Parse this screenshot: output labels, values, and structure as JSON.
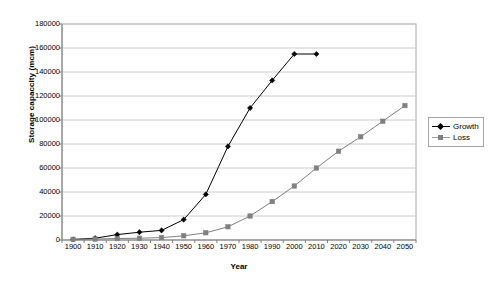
{
  "chart_data": {
    "type": "line",
    "title": "",
    "xlabel": "Year",
    "ylabel": "Storage capaccity (mcm)",
    "categories": [
      1900,
      1910,
      1920,
      1930,
      1940,
      1950,
      1960,
      1970,
      1980,
      1990,
      2000,
      2010,
      2020,
      2030,
      2040,
      2050
    ],
    "xtick_labels": [
      "1900",
      "1910",
      "1920",
      "1930",
      "1940",
      "1950",
      "1960",
      "1970",
      "1980",
      "1990",
      "2000",
      "2010",
      "2020",
      "2030",
      "2040",
      "2050"
    ],
    "ytick_labels": [
      "0",
      "20000",
      "40000",
      "60000",
      "80000",
      "100000",
      "120000",
      "140000",
      "160000",
      "180000"
    ],
    "yticks": [
      0,
      20000,
      40000,
      60000,
      80000,
      100000,
      120000,
      140000,
      160000,
      180000
    ],
    "ylim": [
      0,
      180000
    ],
    "grid": "horizontal",
    "legend_position": "right",
    "series": [
      {
        "name": "Growth",
        "color": "#000000",
        "marker": "diamond",
        "values": [
          500,
          1500,
          4500,
          6500,
          8000,
          17000,
          38000,
          78000,
          110000,
          133000,
          155000,
          155000,
          null,
          null,
          null,
          null
        ]
      },
      {
        "name": "Loss",
        "color": "#808080",
        "marker": "square",
        "values": [
          500,
          800,
          1200,
          1500,
          2000,
          3500,
          6000,
          11000,
          20000,
          32000,
          45000,
          60000,
          74000,
          86000,
          99000,
          112000
        ]
      }
    ]
  },
  "axes": {
    "y_title": "Storage capaccity (mcm)",
    "x_title": "Year"
  },
  "legend": {
    "entries": [
      {
        "label": "Growth"
      },
      {
        "label": "Loss"
      }
    ]
  },
  "colors": {
    "growth": "#000000",
    "loss": "#808080",
    "grid": "#cccccc",
    "axis": "#808080",
    "plot_border": "#a6a6a6",
    "background": "#ffffff"
  }
}
